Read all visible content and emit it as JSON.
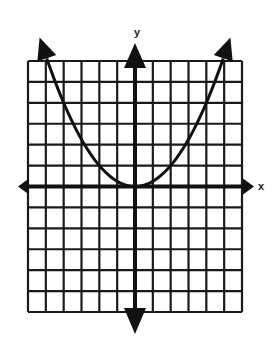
{
  "chart_data": {
    "type": "line",
    "title": "",
    "xlabel": "x",
    "ylabel": "y",
    "xlim": [
      -6,
      6
    ],
    "ylim": [
      -6,
      6
    ],
    "grid": true,
    "grid_cells": {
      "columns": 12,
      "rows": 12
    },
    "tick_labels": false,
    "legend": null,
    "series": [
      {
        "name": "parabola",
        "equation": "y = 0.25x^2",
        "vertex": [
          0,
          0
        ],
        "opens": "up",
        "arrows_on_ends": true,
        "x": [
          -5.2,
          -5,
          -4,
          -3,
          -2,
          -1,
          0,
          1,
          2,
          3,
          4,
          5,
          5.2
        ],
        "y": [
          6.76,
          6.25,
          4,
          2.25,
          1,
          0.25,
          0,
          0.25,
          1,
          2.25,
          4,
          6.25,
          6.76
        ]
      }
    ],
    "colors": {
      "grid": "#1a1a1a",
      "axes": "#111111",
      "curve": "#111111",
      "background": "#ffffff"
    }
  }
}
